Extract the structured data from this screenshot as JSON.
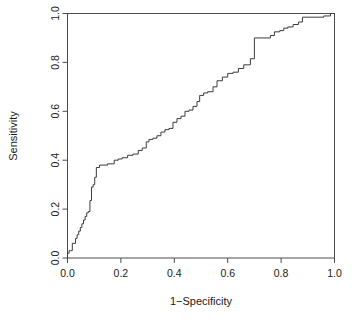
{
  "chart_data": {
    "type": "line",
    "title": "",
    "xlabel": "1−Specificity",
    "ylabel": "Sensitivity",
    "xlim": [
      0.0,
      1.0
    ],
    "ylim": [
      0.0,
      1.0
    ],
    "grid": false,
    "legend": false,
    "line_color": "#3c3c3c",
    "background_color": "#ffffff",
    "xticks": [
      "0.0",
      "0.2",
      "0.4",
      "0.6",
      "0.8",
      "1.0"
    ],
    "xtick_values": [
      0.0,
      0.2,
      0.4,
      0.6,
      0.8,
      1.0
    ],
    "yticks": [
      "0.0",
      "0.2",
      "0.4",
      "0.6",
      "0.8",
      "1.0"
    ],
    "ytick_values": [
      0.0,
      0.2,
      0.4,
      0.6,
      0.8,
      1.0
    ],
    "series": [
      {
        "name": "ROC curve",
        "x": [
          0.0,
          0.0,
          0.006,
          0.006,
          0.012,
          0.012,
          0.018,
          0.018,
          0.03,
          0.03,
          0.036,
          0.036,
          0.042,
          0.042,
          0.048,
          0.048,
          0.054,
          0.054,
          0.06,
          0.06,
          0.066,
          0.066,
          0.072,
          0.072,
          0.078,
          0.078,
          0.084,
          0.084,
          0.09,
          0.09,
          0.096,
          0.096,
          0.102,
          0.102,
          0.108,
          0.108,
          0.12,
          0.12,
          0.15,
          0.15,
          0.175,
          0.175,
          0.19,
          0.19,
          0.205,
          0.205,
          0.225,
          0.225,
          0.245,
          0.245,
          0.265,
          0.265,
          0.28,
          0.28,
          0.295,
          0.295,
          0.305,
          0.305,
          0.32,
          0.32,
          0.335,
          0.335,
          0.35,
          0.35,
          0.365,
          0.365,
          0.38,
          0.38,
          0.395,
          0.395,
          0.41,
          0.41,
          0.425,
          0.425,
          0.44,
          0.44,
          0.455,
          0.455,
          0.47,
          0.47,
          0.485,
          0.485,
          0.495,
          0.495,
          0.51,
          0.51,
          0.525,
          0.525,
          0.545,
          0.545,
          0.56,
          0.56,
          0.58,
          0.58,
          0.6,
          0.6,
          0.62,
          0.62,
          0.64,
          0.64,
          0.66,
          0.66,
          0.685,
          0.685,
          0.7,
          0.7,
          0.76,
          0.76,
          0.775,
          0.775,
          0.795,
          0.795,
          0.81,
          0.81,
          0.825,
          0.825,
          0.845,
          0.845,
          0.865,
          0.865,
          0.88,
          0.88,
          0.96,
          0.96,
          0.985,
          0.985,
          1.0
        ],
        "y": [
          0.0,
          0.02,
          0.02,
          0.03,
          0.03,
          0.03,
          0.03,
          0.06,
          0.06,
          0.08,
          0.08,
          0.095,
          0.095,
          0.11,
          0.11,
          0.125,
          0.125,
          0.14,
          0.14,
          0.155,
          0.155,
          0.17,
          0.17,
          0.185,
          0.185,
          0.19,
          0.19,
          0.235,
          0.235,
          0.29,
          0.29,
          0.3,
          0.3,
          0.33,
          0.33,
          0.37,
          0.37,
          0.38,
          0.38,
          0.385,
          0.385,
          0.4,
          0.4,
          0.405,
          0.405,
          0.41,
          0.41,
          0.42,
          0.42,
          0.425,
          0.425,
          0.44,
          0.44,
          0.45,
          0.45,
          0.475,
          0.475,
          0.485,
          0.485,
          0.49,
          0.49,
          0.5,
          0.5,
          0.515,
          0.515,
          0.525,
          0.525,
          0.53,
          0.53,
          0.555,
          0.555,
          0.57,
          0.57,
          0.58,
          0.58,
          0.6,
          0.6,
          0.605,
          0.605,
          0.62,
          0.62,
          0.64,
          0.64,
          0.665,
          0.665,
          0.675,
          0.675,
          0.68,
          0.68,
          0.7,
          0.7,
          0.725,
          0.725,
          0.74,
          0.74,
          0.755,
          0.755,
          0.76,
          0.76,
          0.775,
          0.775,
          0.79,
          0.79,
          0.815,
          0.815,
          0.9,
          0.9,
          0.91,
          0.91,
          0.925,
          0.925,
          0.93,
          0.93,
          0.94,
          0.94,
          0.945,
          0.945,
          0.955,
          0.955,
          0.965,
          0.965,
          0.985,
          0.985,
          0.99,
          0.99,
          1.0,
          1.0
        ]
      }
    ]
  }
}
